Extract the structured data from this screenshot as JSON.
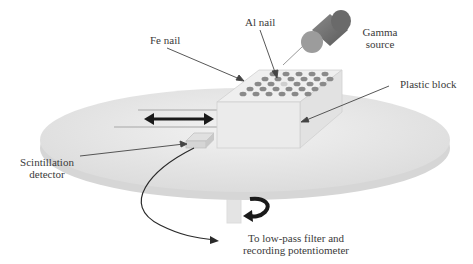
{
  "diagram": {
    "labels": {
      "fe_nail": "Fe nail",
      "al_nail": "Al nail",
      "gamma_source_line1": "Gamma",
      "gamma_source_line2": "source",
      "plastic_block": "Plastic block",
      "scintillation_line1": "Scintillation",
      "scintillation_line2": "detector",
      "output_line1": "To low-pass filter and",
      "output_line2": "recording potentiometer"
    },
    "colors": {
      "disc": "#e6e6e6",
      "disc_edge": "#d4d4d4",
      "block_top": "#eeeeee",
      "block_front": "#e8e8e8",
      "nail": "#8a8a8a",
      "source_body": "#6e6e6e",
      "source_cap": "#9a9a9a",
      "arrow": "#1a1a1a",
      "leader": "#444444",
      "text": "#3a3a3a"
    },
    "nail_grid": {
      "rows": 5,
      "description": "Array of Fe nails on top of plastic block with one Al nail near center"
    }
  }
}
